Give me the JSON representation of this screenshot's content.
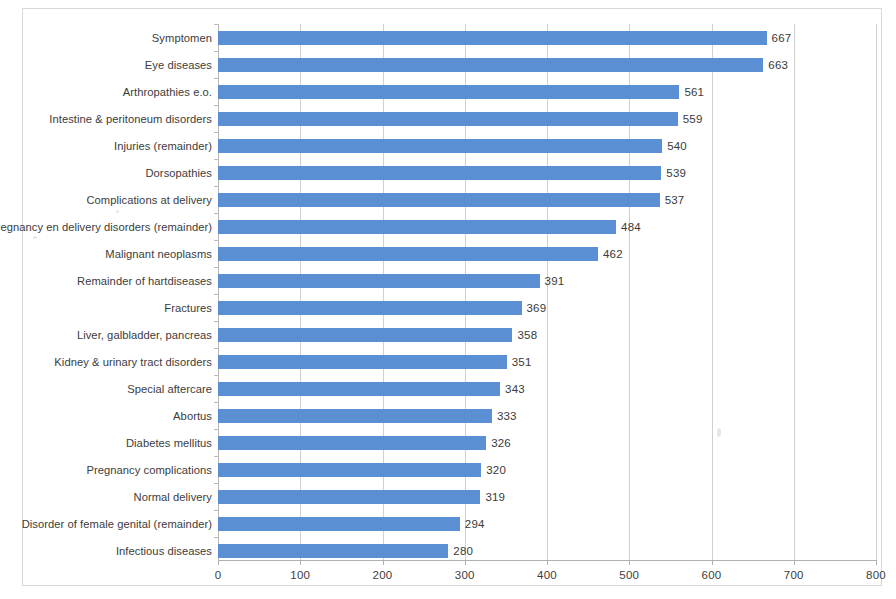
{
  "chart_data": {
    "type": "bar",
    "orientation": "horizontal",
    "title": "",
    "xlabel": "",
    "ylabel": "",
    "xlim": [
      0,
      800
    ],
    "xticks": [
      0,
      100,
      200,
      300,
      400,
      500,
      600,
      700,
      800
    ],
    "grid": true,
    "grid_axis": "x",
    "legend": false,
    "data_labels": true,
    "bar_color": "#5b8fd4",
    "categories": [
      "Symptomen",
      "Eye diseases",
      "Arthropathies e.o.",
      "Intestine & peritoneum disorders",
      "Injuries (remainder)",
      "Dorsopathies",
      "Complications at delivery",
      "Pregnancy en delivery disorders (remainder)",
      "Malignant neoplasms",
      "Remainder of hartdiseases",
      "Fractures",
      "Liver, galbladder, pancreas",
      "Kidney & urinary tract disorders",
      "Special aftercare",
      "Abortus",
      "Diabetes mellitus",
      "Pregnancy complications",
      "Normal delivery",
      "Disorder of female genital (remainder)",
      "Infectious diseases"
    ],
    "values": [
      667,
      663,
      561,
      559,
      540,
      539,
      537,
      484,
      462,
      391,
      369,
      358,
      351,
      343,
      333,
      326,
      320,
      319,
      294,
      280
    ]
  }
}
